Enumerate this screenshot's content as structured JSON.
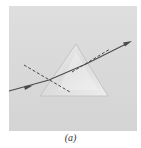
{
  "figure": {
    "caption": "(a)",
    "colors": {
      "panel": "#d9d9d9",
      "prism_fill": "#e6e6e6",
      "prism_edge": "#bdbdbd",
      "ray": "#4a4a4a",
      "normal": "#3a3a3a"
    }
  }
}
